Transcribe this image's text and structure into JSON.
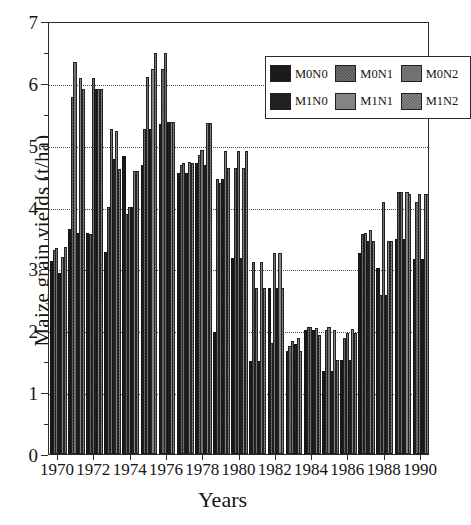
{
  "chart_data": {
    "type": "bar",
    "title": "",
    "xlabel": "Years",
    "ylabel": "Maize grain yields (t/ha)",
    "ylim": [
      0,
      7
    ],
    "ytick_values": [
      0,
      1,
      2,
      3,
      4,
      5,
      6,
      7
    ],
    "ytick_labels": [
      "0",
      "1",
      "2",
      "3",
      "4",
      "5",
      "6",
      "7"
    ],
    "yminor_step": 0.5,
    "grid": "horizontal dotted gridlines at 1,2,3,4,5,6",
    "legend_position": "top-right inside plot",
    "categories": [
      "1970",
      "1971",
      "1972",
      "1973",
      "1974",
      "1975",
      "1976",
      "1977",
      "1978",
      "1979",
      "1980",
      "1981",
      "1982",
      "1983",
      "1984",
      "1985",
      "1986",
      "1987",
      "1988",
      "1989",
      "1990"
    ],
    "xtick_labels": [
      "1970",
      "1972",
      "1974",
      "1976",
      "1978",
      "1980",
      "1982",
      "1984",
      "1986",
      "1988",
      "1990"
    ],
    "series": [
      {
        "name": "M0N0",
        "color": "#1b1b1b",
        "values": [
          3.12,
          3.63,
          3.57,
          3.26,
          4.82,
          4.68,
          5.33,
          4.55,
          4.7,
          1.97,
          3.17,
          1.5,
          2.68,
          1.66,
          2.0,
          1.34,
          1.52,
          3.25,
          3.0,
          3.48,
          3.16
        ]
      },
      {
        "name": "M0N1",
        "color": "#4b4b4b",
        "values": [
          3.3,
          5.77,
          3.55,
          4.0,
          3.88,
          5.25,
          6.22,
          4.67,
          4.83,
          4.45,
          4.62,
          3.1,
          1.8,
          1.74,
          2.06,
          2.0,
          1.88,
          3.55,
          2.57,
          4.23,
          4.08
        ]
      },
      {
        "name": "M0N2",
        "color": "#cfcfcf",
        "values": [
          3.33,
          6.33,
          6.08,
          5.25,
          4.0,
          6.1,
          6.48,
          4.7,
          4.92,
          4.38,
          4.9,
          2.68,
          3.25,
          1.82,
          2.06,
          2.05,
          1.95,
          3.57,
          4.08,
          4.23,
          4.2
        ]
      },
      {
        "name": "M1N0",
        "color": "#6e6e6e",
        "values": [
          2.93,
          3.57,
          5.9,
          4.77,
          4.0,
          5.25,
          5.37,
          4.55,
          4.68,
          4.45,
          3.17,
          1.5,
          2.68,
          1.78,
          2.0,
          1.34,
          1.52,
          3.45,
          2.57,
          3.48,
          3.16
        ]
      },
      {
        "name": "M1N1",
        "color": "#3a3a3a",
        "values": [
          3.18,
          6.08,
          5.9,
          5.22,
          4.58,
          6.22,
          5.37,
          4.72,
          5.35,
          4.9,
          4.62,
          3.1,
          3.25,
          1.88,
          2.03,
          2.0,
          2.02,
          3.62,
          3.45,
          4.23,
          4.2
        ]
      },
      {
        "name": "M1N2",
        "color": "#5c5c5c",
        "values": [
          3.35,
          5.9,
          5.9,
          4.6,
          4.58,
          6.48,
          5.37,
          4.7,
          5.35,
          4.63,
          4.9,
          2.68,
          2.68,
          1.67,
          1.93,
          1.52,
          1.95,
          3.45,
          3.45,
          4.2,
          4.2
        ]
      }
    ]
  },
  "legend": {
    "items": [
      {
        "label": "M0N0",
        "swatch": "s0"
      },
      {
        "label": "M0N1",
        "swatch": "s1"
      },
      {
        "label": "M0N2",
        "swatch": "s2"
      },
      {
        "label": "M1N0",
        "swatch": "s3"
      },
      {
        "label": "M1N1",
        "swatch": "s4"
      },
      {
        "label": "M1N2",
        "swatch": "s5"
      }
    ]
  }
}
